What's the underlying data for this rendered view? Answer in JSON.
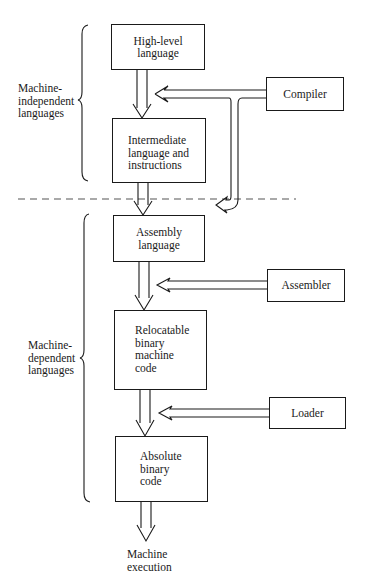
{
  "diagram": {
    "title": "",
    "groups": [
      {
        "id": "independent",
        "label": "Machine-\nindependent\nlanguages"
      },
      {
        "id": "dependent",
        "label": "Machine-\ndependent\nlanguages"
      }
    ],
    "stages": [
      {
        "id": "high_level",
        "label": "High-level\nlanguage"
      },
      {
        "id": "intermediate",
        "label": "Intermediate\nlanguage and\ninstructions"
      },
      {
        "id": "assembly",
        "label": "Assembly\nlanguage"
      },
      {
        "id": "relocatable",
        "label": "Relocatable\nbinary\nmachine\ncode"
      },
      {
        "id": "absolute",
        "label": "Absolute\nbinary\ncode"
      }
    ],
    "tools": [
      {
        "id": "compiler",
        "label": "Compiler",
        "feeds": [
          "high_level->intermediate",
          "intermediate->assembly"
        ]
      },
      {
        "id": "assembler",
        "label": "Assembler",
        "feeds": [
          "assembly->relocatable"
        ]
      },
      {
        "id": "loader",
        "label": "Loader",
        "feeds": [
          "relocatable->absolute"
        ]
      }
    ],
    "output": {
      "label": "Machine\nexecution"
    },
    "separator": "dashed line between machine-independent and machine-dependent languages"
  }
}
